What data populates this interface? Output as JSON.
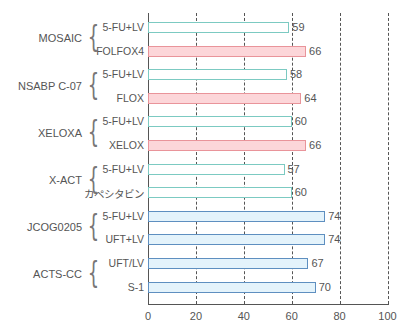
{
  "chart_data": {
    "type": "bar",
    "orientation": "horizontal",
    "title": "",
    "xlabel": "",
    "ylabel": "",
    "xlim": [
      0,
      100
    ],
    "xticks": [
      0,
      20,
      40,
      60,
      80,
      100
    ],
    "grid": "vertical dashed at 20, 40, 60, 80, 100",
    "legend": null,
    "groups": [
      {
        "trial": "MOSAIC",
        "arms": [
          {
            "label": "5-FU+LV",
            "value": 59,
            "style": "control"
          },
          {
            "label": "FOLFOX4",
            "value": 66,
            "style": "oxali"
          }
        ]
      },
      {
        "trial": "NSABP C-07",
        "arms": [
          {
            "label": "5-FU+LV",
            "value": 58,
            "style": "control"
          },
          {
            "label": "FLOX",
            "value": 64,
            "style": "oxali"
          }
        ]
      },
      {
        "trial": "XELOXA",
        "arms": [
          {
            "label": "5-FU+LV",
            "value": 60,
            "style": "control"
          },
          {
            "label": "XELOX",
            "value": 66,
            "style": "oxali"
          }
        ]
      },
      {
        "trial": "X-ACT",
        "arms": [
          {
            "label": "5-FU+LV",
            "value": 57,
            "style": "control"
          },
          {
            "label": "カペシタビン",
            "value": 60,
            "style": "control"
          }
        ]
      },
      {
        "trial": "JCOG0205",
        "arms": [
          {
            "label": "5-FU+LV",
            "value": 74,
            "style": "japan"
          },
          {
            "label": "UFT+LV",
            "value": 74,
            "style": "japan"
          }
        ]
      },
      {
        "trial": "ACTS-CC",
        "arms": [
          {
            "label": "UFT/LV",
            "value": 67,
            "style": "japan"
          },
          {
            "label": "S-1",
            "value": 70,
            "style": "japan"
          }
        ]
      }
    ],
    "categories": [
      "MOSAIC 5-FU+LV",
      "MOSAIC FOLFOX4",
      "NSABP C-07 5-FU+LV",
      "NSABP C-07 FLOX",
      "XELOXA 5-FU+LV",
      "XELOXA XELOX",
      "X-ACT 5-FU+LV",
      "X-ACT カペシタビン",
      "JCOG0205 5-FU+LV",
      "JCOG0205 UFT+LV",
      "ACTS-CC UFT/LV",
      "ACTS-CC S-1"
    ],
    "values": [
      59,
      66,
      58,
      64,
      60,
      66,
      57,
      60,
      74,
      74,
      67,
      70
    ]
  },
  "colors": {
    "control_border": "#7ccac2",
    "control_fill": "#ffffff",
    "oxali_border": "#e9949a",
    "oxali_fill": "#fcd6d9",
    "japan_border": "#5e8fc0",
    "japan_fill": "#e4f3fb",
    "axis": "#555555",
    "text": "#555555"
  }
}
